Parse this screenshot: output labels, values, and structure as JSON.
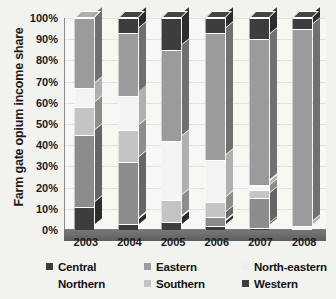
{
  "chart_data": {
    "type": "bar",
    "stacked": true,
    "percent_stacked": true,
    "title": "",
    "xlabel": "",
    "ylabel": "Farm gate opium income share",
    "ylim": [
      0,
      100
    ],
    "ytick_labels": [
      "100%",
      "90%",
      "80%",
      "70%",
      "60%",
      "50%",
      "40%",
      "30%",
      "20%",
      "10%",
      "0%"
    ],
    "ytick_values": [
      100,
      90,
      80,
      70,
      60,
      50,
      40,
      30,
      20,
      10,
      0
    ],
    "grid": true,
    "legend_position": "bottom",
    "categories": [
      "2003",
      "2004",
      "2005",
      "2006",
      "2007",
      "2008"
    ],
    "series": [
      {
        "name": "Central",
        "color": "#3d3d3d",
        "values": [
          11,
          3,
          4,
          2,
          1,
          0
        ]
      },
      {
        "name": "Northern",
        "color": "#8c8c8c",
        "values": [
          34,
          29,
          0,
          4,
          14,
          0
        ]
      },
      {
        "name": "Southern",
        "color": "#c4c4c4",
        "values": [
          13,
          15,
          10,
          7,
          4,
          0
        ]
      },
      {
        "name": "North-eastern",
        "color": "#f4f4f2",
        "values": [
          9,
          16,
          28,
          20,
          2,
          2
        ]
      },
      {
        "name": "Eastern",
        "color": "#9b9b9b",
        "values": [
          33,
          30,
          43,
          60,
          69,
          93
        ]
      },
      {
        "name": "Western",
        "color": "#3d3d3d",
        "values": [
          0,
          7,
          15,
          7,
          10,
          5
        ]
      }
    ],
    "stack_order_bottom_to_top": [
      "Central",
      "Northern",
      "Southern",
      "North-eastern",
      "Eastern",
      "Western"
    ]
  },
  "legend": {
    "entries": [
      {
        "label": "Central",
        "color": "#3d3d3d",
        "has_swatch": true
      },
      {
        "label": "Eastern",
        "color": "#9b9b9b",
        "has_swatch": true
      },
      {
        "label": "North-eastern",
        "color": "#eeeeec",
        "has_swatch": true
      },
      {
        "label": "Northern",
        "color": "#8c8c8c",
        "has_swatch": false
      },
      {
        "label": "Southern",
        "color": "#c4c4c4",
        "has_swatch": true
      },
      {
        "label": "Western",
        "color": "#3d3d3d",
        "has_swatch": true
      }
    ]
  },
  "colors": {
    "background": "#f2f2ef",
    "plot_background": "#f7f7f4",
    "floor": "#6e6e6e",
    "gridline": "#bdbdbd",
    "text": "#1b1b1b"
  }
}
